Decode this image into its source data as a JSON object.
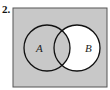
{
  "problem": {
    "number": "2."
  },
  "diagram": {
    "type": "venn",
    "sets": [
      {
        "label": "A",
        "shaded": true
      },
      {
        "label": "B",
        "shaded": false
      }
    ],
    "intersection_shaded": true,
    "universe_shaded": true,
    "colors": {
      "shade": "#c8c8c8",
      "unshaded": "#ffffff",
      "stroke": "#111111",
      "frame": "#555555"
    }
  }
}
